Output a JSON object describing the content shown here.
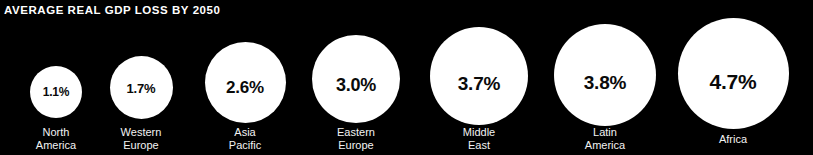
{
  "title": "AVERAGE REAL GDP LOSS BY 2050",
  "colors": {
    "background": "#000000",
    "bubble": "#ffffff",
    "value_text": "#0a0a0a",
    "label_text": "#f2f2f2",
    "title_text": "#ffffff"
  },
  "chart_data": {
    "type": "bubble",
    "title": "AVERAGE REAL GDP LOSS BY 2050",
    "xlabel": "",
    "ylabel": "",
    "unit": "percent",
    "legend": "none",
    "grid": false,
    "categories": [
      "North America",
      "Western Europe",
      "Asia Pacific",
      "Eastern Europe",
      "Middle East",
      "Latin America",
      "Africa"
    ],
    "values": [
      1.1,
      1.7,
      2.6,
      3.0,
      3.7,
      3.8,
      4.7
    ],
    "value_labels": [
      "1.1%",
      "1.7%",
      "2.6%",
      "3.0%",
      "3.7%",
      "3.8%",
      "4.7%"
    ]
  },
  "bubbles": [
    {
      "name": "north-america",
      "value_label": "1.1%",
      "label": "North\nAmerica",
      "center_x": 56,
      "diameter": 52,
      "circle_top": 66,
      "value_font": 12,
      "value_y": 86,
      "label_y": 126
    },
    {
      "name": "western-europe",
      "value_label": "1.7%",
      "label": "Western\nEurope",
      "center_x": 141,
      "diameter": 63,
      "circle_top": 56,
      "value_font": 13,
      "value_y": 82,
      "label_y": 126
    },
    {
      "name": "asia-pacific",
      "value_label": "2.6%",
      "label": "Asia\nPacific",
      "center_x": 245,
      "diameter": 81,
      "circle_top": 42,
      "value_font": 17,
      "value_y": 79,
      "label_y": 126
    },
    {
      "name": "eastern-europe",
      "value_label": "3.0%",
      "label": "Eastern\nEurope",
      "center_x": 356,
      "diameter": 88,
      "circle_top": 35,
      "value_font": 18,
      "value_y": 76,
      "label_y": 126
    },
    {
      "name": "middle-east",
      "value_label": "3.7%",
      "label": "Middle\nEast",
      "center_x": 479,
      "diameter": 98,
      "circle_top": 27,
      "value_font": 19,
      "value_y": 74,
      "label_y": 126
    },
    {
      "name": "latin-america",
      "value_label": "3.8%",
      "label": "Latin\nAmerica",
      "center_x": 605,
      "diameter": 102,
      "circle_top": 24,
      "value_font": 19,
      "value_y": 73,
      "label_y": 126
    },
    {
      "name": "africa",
      "value_label": "4.7%",
      "label": "Africa",
      "center_x": 733,
      "diameter": 111,
      "circle_top": 18,
      "value_font": 21,
      "value_y": 71,
      "label_y": 133
    }
  ]
}
